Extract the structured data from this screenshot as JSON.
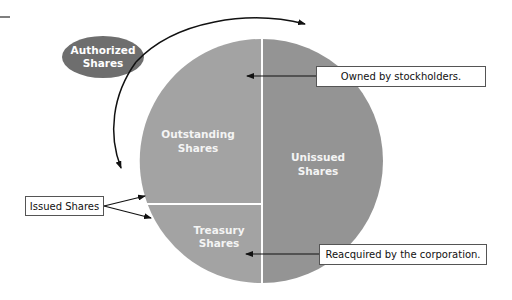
{
  "diagram": {
    "type": "pie-partition-diagram",
    "colors": {
      "outstanding": "#a3a3a3",
      "treasury": "#a3a3a3",
      "unissued": "#949494",
      "authorized_ellipse": "#6e6e6e",
      "divider": "#ffffff",
      "arrow": "#111111"
    },
    "ellipse": {
      "label_line1": "Authorized",
      "label_line2": "Shares"
    },
    "slices": [
      {
        "id": "outstanding",
        "label_line1": "Outstanding",
        "label_line2": "Shares"
      },
      {
        "id": "unissued",
        "label_line1": "Unissued",
        "label_line2": "Shares"
      },
      {
        "id": "treasury",
        "label_line1": "Treasury",
        "label_line2": "Shares"
      }
    ],
    "callouts": {
      "owned": "Owned by stockholders.",
      "reacquired": "Reacquired by the corporation.",
      "issued": "Issued Shares"
    }
  }
}
